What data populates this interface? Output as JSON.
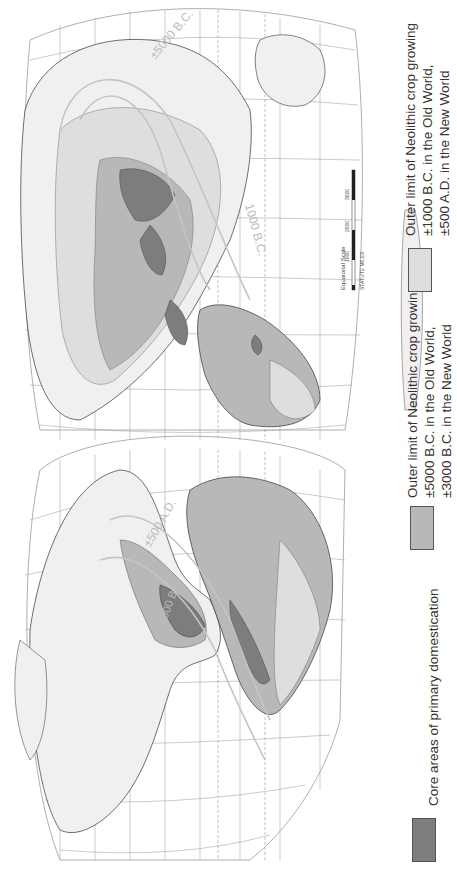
{
  "map": {
    "title": "",
    "orientation": "rotated 90° counter-clockwise (landscape world map shown in portrait)",
    "projection": "interrupted world projection (Americas lobe + Old World lobe)",
    "grid_labels": {
      "latitudes": [
        "90",
        "75",
        "60",
        "45",
        "30",
        "15",
        "0",
        "15",
        "30",
        "45",
        "60",
        "75",
        "90"
      ],
      "longitudes": [
        "180",
        "165",
        "150",
        "135",
        "120",
        "105",
        "90",
        "75",
        "60",
        "30",
        "0",
        "30",
        "60",
        "90",
        "120",
        "150",
        "180"
      ]
    },
    "contour_labels": {
      "new_world_outer": "±500 A.D.",
      "new_world_inner": "3000 B.C.",
      "old_world_inner": "±5000 B.C.",
      "old_world_outer": "1000 B.C."
    },
    "scale": {
      "title": "Equatorial Scale",
      "unit": "STATUTE MILES",
      "ticks": [
        "0",
        "1000",
        "2000",
        "3000"
      ]
    },
    "colors": {
      "core": "#7d7d7d",
      "outer_5000": "#b8b8b8",
      "outer_1000": "#dedede",
      "land": "#f0f0f0",
      "grid": "#9a9a9a",
      "contour": "#c4c4c4",
      "coast": "#333333"
    }
  },
  "legend": {
    "items": [
      {
        "label": "Core areas of primary domestication",
        "lines": [
          "Core areas of primary domestication"
        ],
        "color": "#7d7d7d"
      },
      {
        "label": "Outer limit of Neolithic crop growing ±5000 B.C. in the Old World, ±3000 B.C. in the New World",
        "lines": [
          "Outer limit of Neolithic crop growing",
          "±5000 B.C. in the Old World,",
          "±3000 B.C. in the New World"
        ],
        "color": "#b8b8b8"
      },
      {
        "label": "Outer limit of Neolithic crop growing ±1000 B.C. in the Old World, ±500 A.D. in the New World",
        "lines": [
          "Outer limit of Neolithic crop growing",
          "±1000 B.C. in the Old World,",
          "±500 A.D. in the New World"
        ],
        "color": "#dedede"
      }
    ]
  }
}
